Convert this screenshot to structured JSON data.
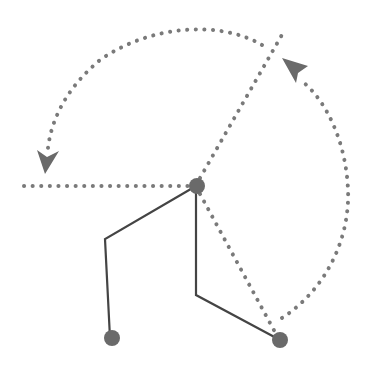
{
  "diagram": {
    "type": "rotation-joint",
    "colors": {
      "dotted": "#7a7a7a",
      "solid": "#444444",
      "node": "#6a6a6a",
      "background": "#ffffff"
    },
    "nodes": [
      {
        "id": "pivot",
        "x": 196,
        "y": 186
      },
      {
        "id": "left-end",
        "x": 112,
        "y": 338
      },
      {
        "id": "right-end",
        "x": 280,
        "y": 340
      }
    ],
    "solid_paths": [
      {
        "id": "left-limb",
        "points": "196,186 105,239 110,338"
      },
      {
        "id": "right-limb",
        "points": "196,186 196,295 280,340"
      }
    ],
    "dotted_lines": [
      {
        "id": "horizontal-ref",
        "x1": 24,
        "y1": 186,
        "x2": 196,
        "y2": 186
      },
      {
        "id": "upper-ref",
        "x1": 196,
        "y1": 186,
        "x2": 283,
        "y2": 33
      },
      {
        "id": "lower-ref",
        "x1": 196,
        "y1": 186,
        "x2": 276,
        "y2": 334
      }
    ],
    "arcs": [
      {
        "id": "top-arc",
        "d": "M 262 45 C 220 20, 150 25, 100 60 C 70 85, 52 115, 48 150"
      },
      {
        "id": "right-arc",
        "d": "M 282 318 C 325 290, 350 240, 348 190 C 346 140, 325 100, 300 78"
      }
    ]
  }
}
